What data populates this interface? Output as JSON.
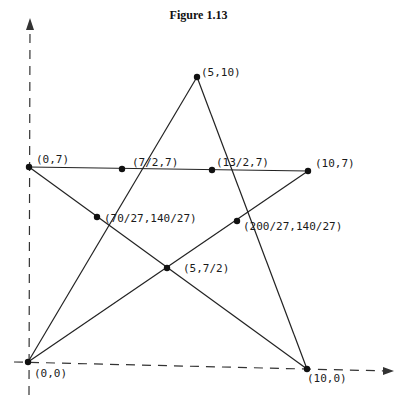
{
  "figure": {
    "title": "Figure 1.13"
  },
  "axes": {
    "x_arrow": true,
    "y_arrow": true,
    "style": "dashed"
  },
  "points": [
    {
      "id": "p00",
      "label": "(0,0)",
      "px": 28,
      "py": 362,
      "lx": 34,
      "ly": 377
    },
    {
      "id": "p100",
      "label": "(10,0)",
      "px": 307,
      "py": 369,
      "lx": 307,
      "ly": 382
    },
    {
      "id": "p510",
      "label": "(5,10)",
      "px": 197,
      "py": 77,
      "lx": 201,
      "ly": 76
    },
    {
      "id": "p07",
      "label": "(0,7)",
      "px": 29,
      "py": 167,
      "lx": 36,
      "ly": 163
    },
    {
      "id": "p107",
      "label": "(10,7)",
      "px": 308,
      "py": 171,
      "lx": 315,
      "ly": 167
    },
    {
      "id": "p727",
      "label": "(7/2,7)",
      "px": 122,
      "py": 169,
      "lx": 132,
      "ly": 166
    },
    {
      "id": "p1327",
      "label": "(13/2,7)",
      "px": 212,
      "py": 170,
      "lx": 216,
      "ly": 166
    },
    {
      "id": "pA",
      "label": "(70/27,140/27)",
      "px": 97,
      "py": 217,
      "lx": 104,
      "ly": 222
    },
    {
      "id": "pB",
      "label": "(200/27,140/27)",
      "px": 237,
      "py": 221,
      "lx": 243,
      "ly": 230
    },
    {
      "id": "pC",
      "label": "(5,7/2)",
      "px": 167,
      "py": 268,
      "lx": 183,
      "ly": 272
    }
  ]
}
